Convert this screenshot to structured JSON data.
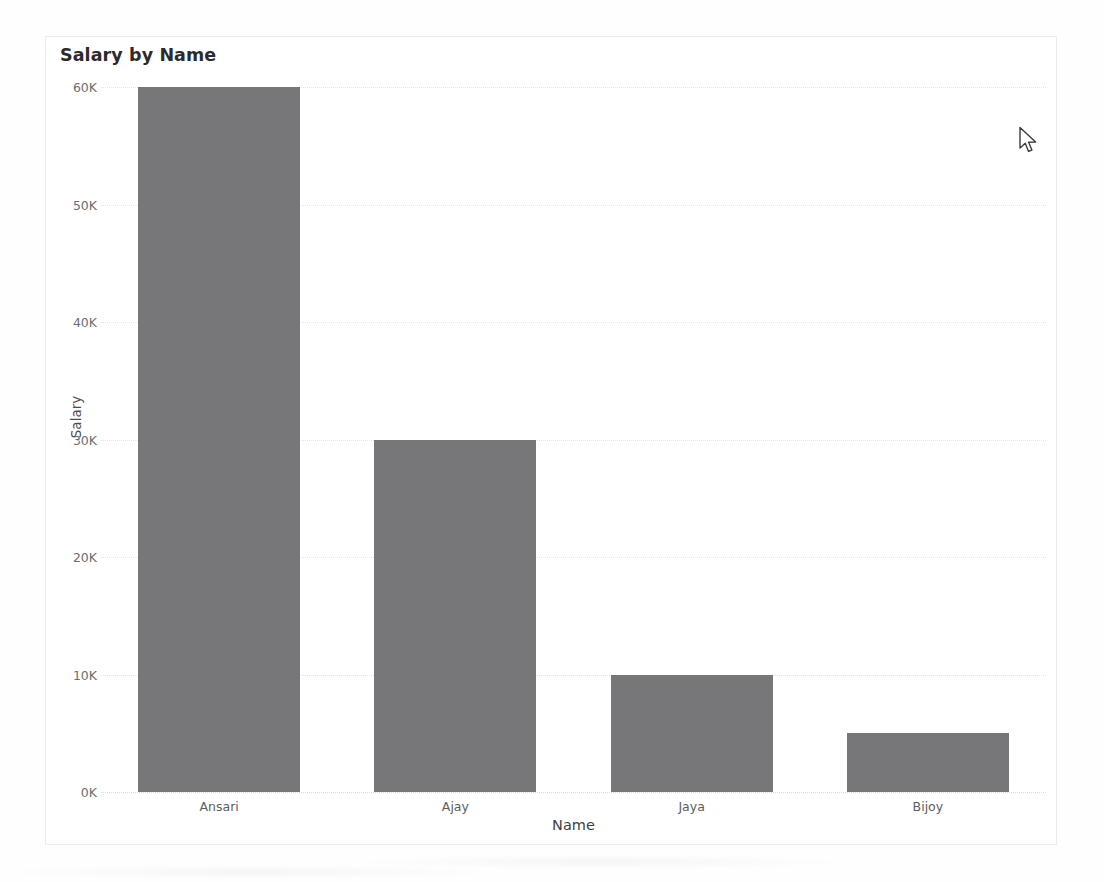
{
  "card": {
    "title": "Salary by Name"
  },
  "cursor": {
    "icon": "mouse-pointer-icon",
    "x": 1025,
    "y": 140
  },
  "colors": {
    "bar": "#777779",
    "gridline": "#e3e3e4",
    "card_border": "#ececed",
    "title_text": "#2b2b2b",
    "tick_text": "#6d6d6d",
    "page_background": "#fefefe"
  },
  "chart_data": {
    "type": "bar",
    "title": "Salary by Name",
    "xlabel": "Name",
    "ylabel": "Salary",
    "categories": [
      "Ansari",
      "Ajay",
      "Jaya",
      "Bijoy"
    ],
    "values": [
      60000,
      30000,
      10000,
      5000
    ],
    "ylim": [
      0,
      60000
    ],
    "yticks": [
      0,
      10000,
      20000,
      30000,
      40000,
      50000,
      60000
    ],
    "ytick_labels": [
      "0K",
      "10K",
      "20K",
      "30K",
      "40K",
      "50K",
      "60K"
    ],
    "grid": true,
    "grid_axis": "y",
    "grid_style": "dotted",
    "legend": false,
    "orientation": "vertical",
    "series": [
      {
        "name": "Salary",
        "values": [
          60000,
          30000,
          10000,
          5000
        ],
        "color": "#777779"
      }
    ]
  }
}
